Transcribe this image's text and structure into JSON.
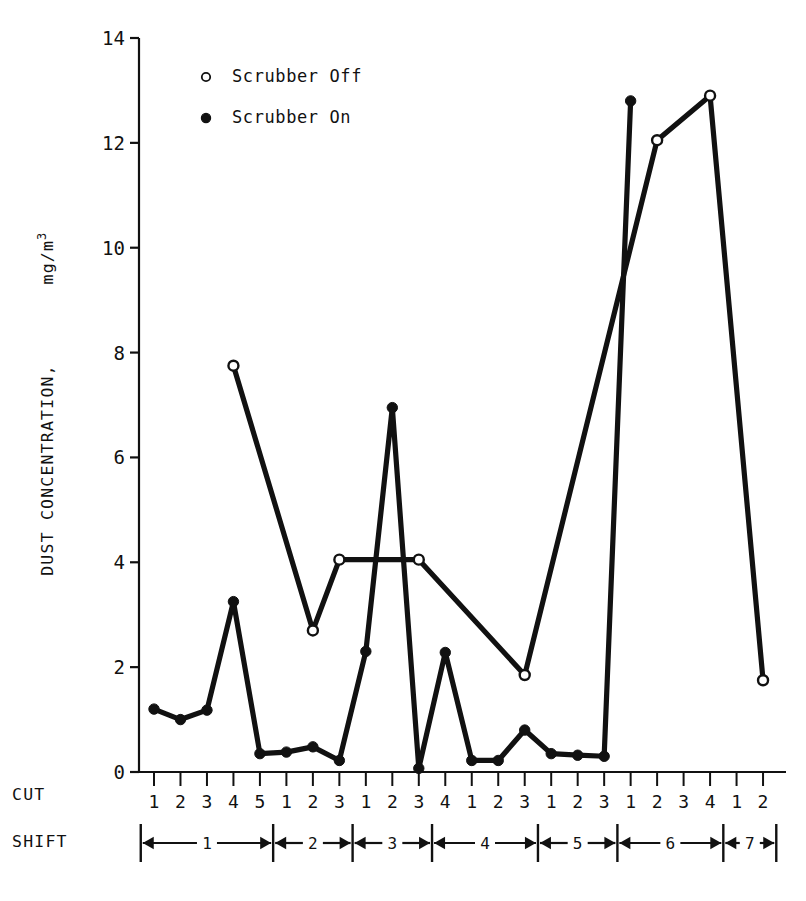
{
  "chart_data": {
    "type": "line",
    "title": "",
    "xlabel": "CUT",
    "ylabel": "DUST CONCENTRATION, mg/m3",
    "ylabel_main": "DUST CONCENTRATION,",
    "ylabel_unit_base": "mg/m",
    "ylabel_unit_exp": "3",
    "ylim": [
      0,
      14
    ],
    "ytick_values": [
      0,
      2,
      4,
      6,
      8,
      10,
      12,
      14
    ],
    "ytick_labels": [
      "0",
      "2",
      "4",
      "6",
      "8",
      "10",
      "12",
      "14"
    ],
    "grid": false,
    "legend_position": "top-left-inside",
    "x_index": [
      1,
      2,
      3,
      4,
      5,
      6,
      7,
      8,
      9,
      10,
      11,
      12,
      13,
      14,
      15,
      16,
      17,
      18,
      19,
      20,
      21,
      22,
      23,
      24
    ],
    "cut_labels": [
      "1",
      "2",
      "3",
      "4",
      "5",
      "1",
      "2",
      "3",
      "1",
      "2",
      "3",
      "4",
      "1",
      "2",
      "3",
      "1",
      "2",
      "3",
      "1",
      "2",
      "3",
      "4",
      "1",
      "2",
      "3"
    ],
    "cut_tick_labels": [
      "1",
      "2",
      "3",
      "4",
      "5",
      "1",
      "2",
      "3",
      "1",
      "2",
      "3",
      "4",
      "1",
      "2",
      "3",
      "1",
      "2",
      "3",
      "1",
      "2",
      "3",
      "4",
      "1",
      "2",
      "3"
    ],
    "series": [
      {
        "name": "Scrubber Off",
        "marker": "open-circle",
        "points": [
          {
            "i": 4,
            "cut": "4",
            "shift": 1,
            "value": 7.75
          },
          {
            "i": 7,
            "cut": "2",
            "shift": 2,
            "value": 2.7
          },
          {
            "i": 8,
            "cut": "3",
            "shift": 2,
            "value": 4.05
          },
          {
            "i": 11,
            "cut": "3",
            "shift": 3,
            "value": 4.05
          },
          {
            "i": 15,
            "cut": "3",
            "shift": 4,
            "value": 1.85
          },
          {
            "i": 20,
            "cut": "2",
            "shift": 6,
            "value": 12.05
          },
          {
            "i": 22,
            "cut": "4",
            "shift": 6,
            "value": 12.9
          },
          {
            "i": 24,
            "cut": "2",
            "shift": 7,
            "value": 1.75
          }
        ]
      },
      {
        "name": "Scrubber On",
        "marker": "filled-circle",
        "points": [
          {
            "i": 1,
            "cut": "1",
            "shift": 1,
            "value": 1.2
          },
          {
            "i": 2,
            "cut": "2",
            "shift": 1,
            "value": 1.0
          },
          {
            "i": 3,
            "cut": "3",
            "shift": 1,
            "value": 1.18
          },
          {
            "i": 4,
            "cut": "4",
            "shift": 1,
            "value": 3.25
          },
          {
            "i": 5,
            "cut": "5",
            "shift": 1,
            "value": 0.35
          },
          {
            "i": 6,
            "cut": "1",
            "shift": 2,
            "value": 0.38
          },
          {
            "i": 7,
            "cut": "2",
            "shift": 2,
            "value": 0.48
          },
          {
            "i": 8,
            "cut": "3",
            "shift": 2,
            "value": 0.22
          },
          {
            "i": 9,
            "cut": "1",
            "shift": 3,
            "value": 2.3
          },
          {
            "i": 10,
            "cut": "2",
            "shift": 3,
            "value": 6.95
          },
          {
            "i": 11,
            "cut": "3",
            "shift": 3,
            "value": 0.07
          },
          {
            "i": 12,
            "cut": "4",
            "shift": 3,
            "value": 2.28
          },
          {
            "i": 13,
            "cut": "1",
            "shift": 4,
            "value": 0.22
          },
          {
            "i": 14,
            "cut": "2",
            "shift": 4,
            "value": 0.22
          },
          {
            "i": 15,
            "cut": "3",
            "shift": 4,
            "value": 0.8
          },
          {
            "i": 16,
            "cut": "1",
            "shift": 5,
            "value": 0.35
          },
          {
            "i": 17,
            "cut": "2",
            "shift": 5,
            "value": 0.32
          },
          {
            "i": 18,
            "cut": "3",
            "shift": 5,
            "value": 0.3
          },
          {
            "i": 19,
            "cut": "1",
            "shift": 6,
            "value": 12.8
          }
        ]
      }
    ],
    "legend": [
      {
        "label": "Scrubber Off",
        "marker": "open-circle"
      },
      {
        "label": "Scrubber On",
        "marker": "filled-circle"
      }
    ],
    "shift_row_label": "SHIFT",
    "cut_row_label": "CUT",
    "shifts": [
      {
        "label": "1",
        "cuts": 5
      },
      {
        "label": "2",
        "cuts": 3
      },
      {
        "label": "3",
        "cuts": 3
      },
      {
        "label": "4",
        "cuts": 4
      },
      {
        "label": "5",
        "cuts": 3
      },
      {
        "label": "6",
        "cuts": 4
      },
      {
        "label": "7",
        "cuts": 3
      }
    ]
  },
  "colors": {
    "ink": "#111111",
    "background": "#ffffff"
  }
}
